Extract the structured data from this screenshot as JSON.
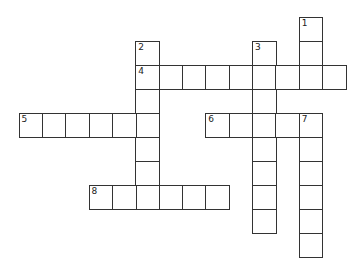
{
  "puzzle": {
    "type": "crossword",
    "grid": {
      "origin_x": 18.5,
      "origin_y": 17,
      "cell_w": 23.35,
      "cell_h": 24
    },
    "words": [
      {
        "number": "1",
        "direction": "down",
        "row": 0,
        "col": 12,
        "length": 3
      },
      {
        "number": "2",
        "direction": "down",
        "row": 1,
        "col": 5,
        "length": 7
      },
      {
        "number": "3",
        "direction": "down",
        "row": 1,
        "col": 10,
        "length": 8
      },
      {
        "number": "4",
        "direction": "across",
        "row": 2,
        "col": 5,
        "length": 9
      },
      {
        "number": "5",
        "direction": "across",
        "row": 4,
        "col": 0,
        "length": 6
      },
      {
        "number": "6",
        "direction": "across",
        "row": 4,
        "col": 8,
        "length": 5
      },
      {
        "number": "7",
        "direction": "down",
        "row": 4,
        "col": 12,
        "length": 6
      },
      {
        "number": "8",
        "direction": "across",
        "row": 7,
        "col": 3,
        "length": 6
      }
    ]
  }
}
